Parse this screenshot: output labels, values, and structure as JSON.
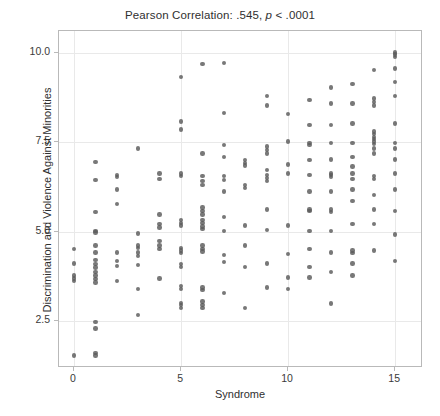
{
  "chart_data": {
    "type": "scatter",
    "title": "Pearson Correlation: .545, p < .0001",
    "title_prefix": "Pearson Correlation: .545, ",
    "title_italic": "p",
    "title_suffix": " < .0001",
    "statistic_name": "Pearson Correlation",
    "statistic_value": ".545",
    "p_value": "< .0001",
    "xlabel": "Syndrome",
    "ylabel": "Discrimination and Violence Against Minorities",
    "xlim": [
      -0.7,
      16.3
    ],
    "ylim": [
      1.2,
      10.6
    ],
    "xticks": [
      0,
      5,
      10,
      15
    ],
    "xticklabels": [
      "0",
      "5",
      "10",
      "15"
    ],
    "yticks": [
      2.5,
      5.0,
      7.5,
      10.0
    ],
    "yticklabels": [
      "2.5",
      "5.0",
      "7.5",
      "10.0"
    ],
    "grid": true,
    "legend": "none",
    "marker_color": "#5a5a5a",
    "grid_color": "#e9e9e9",
    "frame_color": "#b9b9b9",
    "background_color": "#ffffff",
    "n_points": 196,
    "points": [
      [
        0,
        1.55
      ],
      [
        0,
        3.62
      ],
      [
        0,
        3.7
      ],
      [
        0,
        3.78
      ],
      [
        0,
        4.12
      ],
      [
        0,
        4.52
      ],
      [
        1,
        1.55
      ],
      [
        1,
        1.62
      ],
      [
        1,
        2.3
      ],
      [
        1,
        2.48
      ],
      [
        1,
        3.58
      ],
      [
        1,
        3.68
      ],
      [
        1,
        3.78
      ],
      [
        1,
        3.88
      ],
      [
        1,
        4.0
      ],
      [
        1,
        4.1
      ],
      [
        1,
        4.22
      ],
      [
        1,
        4.42
      ],
      [
        1,
        4.62
      ],
      [
        1,
        4.98
      ],
      [
        1,
        5.02
      ],
      [
        1,
        5.55
      ],
      [
        1,
        6.45
      ],
      [
        1,
        6.95
      ],
      [
        2,
        3.62
      ],
      [
        2,
        4.05
      ],
      [
        2,
        4.18
      ],
      [
        2,
        4.42
      ],
      [
        2,
        5.78
      ],
      [
        2,
        6.18
      ],
      [
        2,
        6.52
      ],
      [
        2,
        6.58
      ],
      [
        3,
        2.68
      ],
      [
        3,
        3.4
      ],
      [
        3,
        4.08
      ],
      [
        3,
        4.32
      ],
      [
        3,
        4.42
      ],
      [
        3,
        4.55
      ],
      [
        3,
        4.62
      ],
      [
        3,
        4.95
      ],
      [
        3,
        7.32
      ],
      [
        4,
        3.7
      ],
      [
        4,
        4.52
      ],
      [
        4,
        4.62
      ],
      [
        4,
        4.75
      ],
      [
        4,
        5.12
      ],
      [
        4,
        5.22
      ],
      [
        4,
        5.48
      ],
      [
        4,
        6.48
      ],
      [
        4,
        6.62
      ],
      [
        5,
        2.88
      ],
      [
        5,
        2.95
      ],
      [
        5,
        3.02
      ],
      [
        5,
        3.4
      ],
      [
        5,
        3.48
      ],
      [
        5,
        4.02
      ],
      [
        5,
        4.1
      ],
      [
        5,
        4.4
      ],
      [
        5,
        4.48
      ],
      [
        5,
        4.55
      ],
      [
        5,
        5.18
      ],
      [
        5,
        5.25
      ],
      [
        5,
        5.32
      ],
      [
        5,
        6.55
      ],
      [
        5,
        6.62
      ],
      [
        5,
        7.85
      ],
      [
        5,
        8.08
      ],
      [
        5,
        9.32
      ],
      [
        6,
        2.88
      ],
      [
        6,
        2.95
      ],
      [
        6,
        3.05
      ],
      [
        6,
        3.38
      ],
      [
        6,
        3.45
      ],
      [
        6,
        4.45
      ],
      [
        6,
        4.52
      ],
      [
        6,
        4.62
      ],
      [
        6,
        5.08
      ],
      [
        6,
        5.15
      ],
      [
        6,
        5.25
      ],
      [
        6,
        5.32
      ],
      [
        6,
        5.48
      ],
      [
        6,
        5.58
      ],
      [
        6,
        5.68
      ],
      [
        6,
        6.3
      ],
      [
        6,
        6.42
      ],
      [
        6,
        6.55
      ],
      [
        6,
        7.18
      ],
      [
        6,
        9.68
      ],
      [
        7,
        3.3
      ],
      [
        7,
        4.15
      ],
      [
        7,
        4.35
      ],
      [
        7,
        5.02
      ],
      [
        7,
        5.42
      ],
      [
        7,
        6.12
      ],
      [
        7,
        6.45
      ],
      [
        7,
        6.55
      ],
      [
        7,
        7.08
      ],
      [
        7,
        7.42
      ],
      [
        7,
        8.32
      ],
      [
        7,
        9.7
      ],
      [
        8,
        2.88
      ],
      [
        8,
        4.02
      ],
      [
        8,
        4.62
      ],
      [
        8,
        5.18
      ],
      [
        8,
        6.22
      ],
      [
        8,
        6.3
      ],
      [
        8,
        6.85
      ],
      [
        8,
        6.92
      ],
      [
        8,
        7.0
      ],
      [
        9,
        3.45
      ],
      [
        9,
        4.12
      ],
      [
        9,
        5.05
      ],
      [
        9,
        5.62
      ],
      [
        9,
        6.42
      ],
      [
        9,
        6.5
      ],
      [
        9,
        6.58
      ],
      [
        9,
        6.72
      ],
      [
        9,
        7.18
      ],
      [
        9,
        7.28
      ],
      [
        9,
        7.38
      ],
      [
        9,
        8.52
      ],
      [
        9,
        8.78
      ],
      [
        10,
        3.4
      ],
      [
        10,
        3.72
      ],
      [
        10,
        4.38
      ],
      [
        10,
        5.18
      ],
      [
        10,
        6.62
      ],
      [
        10,
        6.88
      ],
      [
        10,
        7.52
      ],
      [
        10,
        8.28
      ],
      [
        11,
        3.72
      ],
      [
        11,
        4.02
      ],
      [
        11,
        4.52
      ],
      [
        11,
        5.02
      ],
      [
        11,
        5.58
      ],
      [
        11,
        5.62
      ],
      [
        11,
        6.12
      ],
      [
        11,
        6.58
      ],
      [
        11,
        7.0
      ],
      [
        11,
        7.42
      ],
      [
        11,
        7.48
      ],
      [
        11,
        7.98
      ],
      [
        11,
        8.68
      ],
      [
        12,
        3.0
      ],
      [
        12,
        3.88
      ],
      [
        12,
        4.42
      ],
      [
        12,
        5.02
      ],
      [
        12,
        5.55
      ],
      [
        12,
        5.62
      ],
      [
        12,
        6.12
      ],
      [
        12,
        6.52
      ],
      [
        12,
        6.58
      ],
      [
        12,
        6.62
      ],
      [
        12,
        7.02
      ],
      [
        12,
        7.48
      ],
      [
        12,
        7.98
      ],
      [
        12,
        8.58
      ],
      [
        12,
        9.02
      ],
      [
        13,
        3.78
      ],
      [
        13,
        4.12
      ],
      [
        13,
        4.4
      ],
      [
        13,
        4.48
      ],
      [
        13,
        5.22
      ],
      [
        13,
        5.85
      ],
      [
        13,
        6.18
      ],
      [
        13,
        6.48
      ],
      [
        13,
        6.62
      ],
      [
        13,
        6.82
      ],
      [
        13,
        7.08
      ],
      [
        13,
        7.48
      ],
      [
        13,
        8.02
      ],
      [
        13,
        8.58
      ],
      [
        13,
        9.12
      ],
      [
        14,
        4.48
      ],
      [
        14,
        5.22
      ],
      [
        14,
        5.62
      ],
      [
        14,
        6.02
      ],
      [
        14,
        6.48
      ],
      [
        14,
        6.55
      ],
      [
        14,
        7.18
      ],
      [
        14,
        7.32
      ],
      [
        14,
        7.45
      ],
      [
        14,
        7.52
      ],
      [
        14,
        7.58
      ],
      [
        14,
        7.65
      ],
      [
        14,
        7.72
      ],
      [
        14,
        7.8
      ],
      [
        14,
        8.52
      ],
      [
        14,
        8.62
      ],
      [
        14,
        8.72
      ],
      [
        14,
        9.52
      ],
      [
        15,
        4.18
      ],
      [
        15,
        4.92
      ],
      [
        15,
        5.58
      ],
      [
        15,
        6.18
      ],
      [
        15,
        6.62
      ],
      [
        15,
        7.02
      ],
      [
        15,
        7.32
      ],
      [
        15,
        7.48
      ],
      [
        15,
        8.02
      ],
      [
        15,
        8.78
      ],
      [
        15,
        9.18
      ],
      [
        15,
        9.55
      ],
      [
        15,
        9.88
      ],
      [
        15,
        9.95
      ],
      [
        15,
        10.0
      ]
    ]
  }
}
